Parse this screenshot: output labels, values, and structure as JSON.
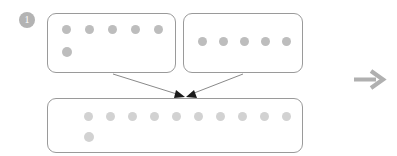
{
  "diagram": {
    "step_badge": {
      "label": "1",
      "shape": "filled-circle",
      "fill_color": "#b3b3b3",
      "text_color": "#ffffff"
    },
    "colors": {
      "box_border": "#9a9a9a",
      "box_fill": "#ffffff",
      "dot_source": "#bdbdbd",
      "dot_result": "#d2d2d2",
      "connector_line": "#6b6b6b",
      "arrowhead": "#1a1a1a",
      "next_arrow": "#b0b0b0",
      "canvas": "#ffffff"
    },
    "boxes": [
      {
        "name": "source-box-a",
        "role": "source",
        "rows": [
          {
            "dot_count": 5,
            "dot_size": 9
          },
          {
            "dot_count": 1,
            "dot_size": 10
          }
        ],
        "total_dots": 6
      },
      {
        "name": "source-box-b",
        "role": "source",
        "rows": [
          {
            "dot_count": 5,
            "dot_size": 9
          }
        ],
        "total_dots": 5
      },
      {
        "name": "result-box",
        "role": "result",
        "rows": [
          {
            "dot_count": 10,
            "dot_size": 9
          },
          {
            "dot_count": 1,
            "dot_size": 10
          }
        ],
        "total_dots": 11
      }
    ],
    "connectors": [
      {
        "name": "connector-a-to-result",
        "from": "source-box-a",
        "to": "result-box",
        "has_arrowhead": true
      },
      {
        "name": "connector-b-to-result",
        "from": "source-box-b",
        "to": "result-box",
        "has_arrowhead": true
      }
    ],
    "next_arrow": {
      "name": "next-step-arrow",
      "icon": "arrow-right-icon",
      "direction": "right"
    }
  }
}
